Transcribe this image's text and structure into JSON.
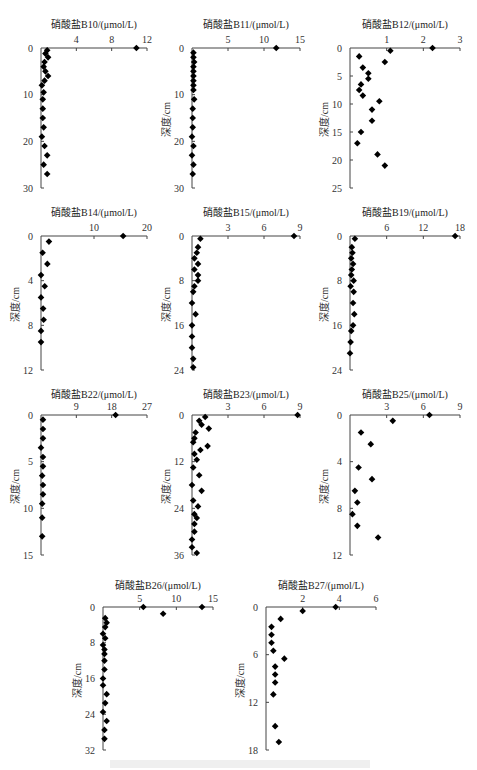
{
  "figure": {
    "y_axis_label": "深度/cm",
    "marker": "diamond",
    "marker_color": "#000000"
  },
  "chart_data": [
    {
      "type": "scatter",
      "id": "B10",
      "title": "硝酸盐B10/(μmol/L)",
      "xlabel": "硝酸盐B10/(μmol/L)",
      "ylabel": "",
      "x_ticks": [
        4,
        8,
        12
      ],
      "x_range": [
        0,
        12
      ],
      "y_ticks": [
        0,
        10,
        20,
        30
      ],
      "y_range": [
        0,
        30
      ],
      "y_inverted": true,
      "points": [
        [
          10.8,
          0
        ],
        [
          0.7,
          0.5
        ],
        [
          0.5,
          1.2
        ],
        [
          0.8,
          2
        ],
        [
          0.4,
          3
        ],
        [
          0.3,
          4
        ],
        [
          0.5,
          5
        ],
        [
          0.8,
          6
        ],
        [
          0.4,
          7
        ],
        [
          0.1,
          8
        ],
        [
          0.3,
          9.5
        ],
        [
          0.2,
          11
        ],
        [
          0.2,
          13
        ],
        [
          0.2,
          15
        ],
        [
          0.3,
          17
        ],
        [
          0.1,
          19
        ],
        [
          0.4,
          21
        ],
        [
          0.7,
          23
        ],
        [
          0.3,
          25
        ],
        [
          0.7,
          27
        ]
      ],
      "layout": {
        "x0": 41,
        "x1": 147,
        "y0": 48,
        "y1": 188,
        "title_y": 16,
        "show_ylabel": false
      }
    },
    {
      "type": "scatter",
      "id": "B11",
      "title": "硝酸盐B11/(μmol/L)",
      "xlabel": "硝酸盐B11/(μmol/L)",
      "ylabel": "深度/cm",
      "x_ticks": [
        5,
        10,
        15
      ],
      "x_range": [
        0,
        15
      ],
      "y_ticks": [
        0,
        10,
        20,
        30
      ],
      "y_range": [
        0,
        30
      ],
      "y_inverted": true,
      "points": [
        [
          11.7,
          0
        ],
        [
          0.2,
          1
        ],
        [
          0.2,
          2
        ],
        [
          0.3,
          3
        ],
        [
          0.2,
          4
        ],
        [
          0.2,
          5
        ],
        [
          0.2,
          6
        ],
        [
          0.2,
          7
        ],
        [
          0.2,
          8
        ],
        [
          0.2,
          9
        ],
        [
          0.3,
          11
        ],
        [
          0.1,
          13
        ],
        [
          0.1,
          15
        ],
        [
          0.1,
          17
        ],
        [
          0.0,
          19
        ],
        [
          0.2,
          21
        ],
        [
          0.0,
          23
        ],
        [
          0.2,
          25
        ],
        [
          0.1,
          27
        ]
      ],
      "layout": {
        "x0": 192,
        "x1": 300,
        "y0": 48,
        "y1": 188,
        "title_y": 16,
        "show_ylabel": true
      }
    },
    {
      "type": "scatter",
      "id": "B12",
      "title": "硝酸盐B12/(μmol/L)",
      "xlabel": "硝酸盐B12/(μmol/L)",
      "ylabel": "深度/cm",
      "x_ticks": [
        1,
        2,
        3
      ],
      "x_range": [
        0,
        3
      ],
      "y_ticks": [
        0,
        5,
        10,
        15,
        20,
        25
      ],
      "y_range": [
        0,
        25
      ],
      "y_inverted": true,
      "points": [
        [
          2.25,
          0
        ],
        [
          1.1,
          0.5
        ],
        [
          0.25,
          1.5
        ],
        [
          0.95,
          2.5
        ],
        [
          0.35,
          3.5
        ],
        [
          0.5,
          4.5
        ],
        [
          0.5,
          5.5
        ],
        [
          0.3,
          6.5
        ],
        [
          0.25,
          7.5
        ],
        [
          0.35,
          8.5
        ],
        [
          0.8,
          9.5
        ],
        [
          0.6,
          11
        ],
        [
          0.6,
          13
        ],
        [
          0.3,
          15
        ],
        [
          0.2,
          17
        ],
        [
          0.75,
          19
        ],
        [
          0.95,
          21
        ]
      ],
      "layout": {
        "x0": 350,
        "x1": 460,
        "y0": 48,
        "y1": 188,
        "title_y": 16,
        "show_ylabel": true
      }
    },
    {
      "type": "scatter",
      "id": "B14",
      "title": "硝酸盐B14/(μmol/L)",
      "xlabel": "硝酸盐B14/(μmol/L)",
      "ylabel": "深度/cm",
      "x_ticks": [
        10,
        20
      ],
      "x_range": [
        0,
        20
      ],
      "y_ticks": [
        0,
        4,
        8,
        12
      ],
      "y_range": [
        0,
        12
      ],
      "y_inverted": true,
      "points": [
        [
          15.5,
          0
        ],
        [
          1.5,
          0.5
        ],
        [
          0.3,
          1.5
        ],
        [
          1.2,
          2.5
        ],
        [
          0,
          3.5
        ],
        [
          0.7,
          4.5
        ],
        [
          0,
          5.5
        ],
        [
          0.4,
          6.5
        ],
        [
          0.5,
          7.5
        ],
        [
          0,
          8.5
        ],
        [
          0,
          9.5
        ]
      ],
      "layout": {
        "x0": 41,
        "x1": 147,
        "y0": 236,
        "y1": 370,
        "title_y": 204,
        "show_ylabel": true
      }
    },
    {
      "type": "scatter",
      "id": "B15",
      "title": "硝酸盐B15/(μmol/L)",
      "xlabel": "硝酸盐B15/(μmol/L)",
      "ylabel": "深度/cm",
      "x_ticks": [
        3,
        6,
        9
      ],
      "x_range": [
        0,
        9
      ],
      "y_ticks": [
        0,
        8,
        16,
        24
      ],
      "y_range": [
        0,
        24
      ],
      "y_inverted": true,
      "points": [
        [
          8.5,
          0
        ],
        [
          0.7,
          0.5
        ],
        [
          0.5,
          2
        ],
        [
          0.4,
          3
        ],
        [
          0.2,
          4
        ],
        [
          0.5,
          5
        ],
        [
          0.2,
          6
        ],
        [
          0.5,
          7
        ],
        [
          0.5,
          8
        ],
        [
          0.2,
          9
        ],
        [
          0.1,
          10
        ],
        [
          0,
          12
        ],
        [
          0.3,
          14
        ],
        [
          0,
          16
        ],
        [
          0,
          18
        ],
        [
          0,
          20
        ],
        [
          0.1,
          22
        ],
        [
          0.1,
          23.5
        ]
      ],
      "layout": {
        "x0": 192,
        "x1": 300,
        "y0": 236,
        "y1": 370,
        "title_y": 204,
        "show_ylabel": true
      }
    },
    {
      "type": "scatter",
      "id": "B19",
      "title": "硝酸盐B19/(μmol/L)",
      "xlabel": "硝酸盐B19/(μmol/L)",
      "ylabel": "深度/cm",
      "x_ticks": [
        6,
        12,
        18
      ],
      "x_range": [
        0,
        18
      ],
      "y_ticks": [
        0,
        8,
        16,
        24
      ],
      "y_range": [
        0,
        24
      ],
      "y_inverted": true,
      "points": [
        [
          17.2,
          0
        ],
        [
          0.8,
          0.5
        ],
        [
          0.3,
          2
        ],
        [
          0.4,
          3
        ],
        [
          0.2,
          4
        ],
        [
          0.5,
          5
        ],
        [
          0.3,
          6
        ],
        [
          0.2,
          7
        ],
        [
          0.6,
          8
        ],
        [
          0.1,
          9
        ],
        [
          0.6,
          10
        ],
        [
          0.5,
          12
        ],
        [
          0.7,
          14
        ],
        [
          0.5,
          16
        ],
        [
          0.2,
          17
        ],
        [
          0.1,
          19
        ],
        [
          0,
          21
        ]
      ],
      "layout": {
        "x0": 350,
        "x1": 460,
        "y0": 236,
        "y1": 370,
        "title_y": 204,
        "show_ylabel": true
      }
    },
    {
      "type": "scatter",
      "id": "B22",
      "title": "硝酸盐B22/(μmol/L)",
      "xlabel": "硝酸盐B22/(μmol/L)",
      "ylabel": "深度/cm",
      "x_ticks": [
        9,
        18,
        27
      ],
      "x_range": [
        0,
        27
      ],
      "y_ticks": [
        0,
        5,
        10,
        15
      ],
      "y_range": [
        0,
        15
      ],
      "y_inverted": true,
      "points": [
        [
          19,
          0
        ],
        [
          0.5,
          0.5
        ],
        [
          0.5,
          1.5
        ],
        [
          0.5,
          2.5
        ],
        [
          0,
          3.5
        ],
        [
          0.5,
          4.5
        ],
        [
          0.5,
          5.5
        ],
        [
          0.3,
          6.5
        ],
        [
          0.5,
          7.5
        ],
        [
          0.5,
          8.5
        ],
        [
          0.3,
          9.5
        ],
        [
          0.3,
          11
        ],
        [
          0.3,
          13
        ]
      ],
      "layout": {
        "x0": 41,
        "x1": 147,
        "y0": 415,
        "y1": 555,
        "title_y": 386,
        "show_ylabel": true
      }
    },
    {
      "type": "scatter",
      "id": "B23",
      "title": "硝酸盐B23/(μmol/L)",
      "xlabel": "硝酸盐B23/(μmol/L)",
      "ylabel": "深度/cm",
      "x_ticks": [
        3,
        6,
        9
      ],
      "x_range": [
        0,
        9
      ],
      "y_ticks": [
        0,
        12,
        24,
        36
      ],
      "y_range": [
        0,
        36
      ],
      "y_inverted": true,
      "points": [
        [
          8.8,
          0
        ],
        [
          1.1,
          0.5
        ],
        [
          0.6,
          1.5
        ],
        [
          0.8,
          2.5
        ],
        [
          1.4,
          3.5
        ],
        [
          0.3,
          4.5
        ],
        [
          0.2,
          6
        ],
        [
          0.1,
          7
        ],
        [
          1.3,
          8
        ],
        [
          0.7,
          9
        ],
        [
          0.2,
          10
        ],
        [
          0.4,
          11.5
        ],
        [
          0.1,
          13.5
        ],
        [
          0.6,
          15.5
        ],
        [
          0,
          18
        ],
        [
          0.8,
          19.5
        ],
        [
          0.1,
          22
        ],
        [
          0.5,
          23.5
        ],
        [
          0.2,
          25.5
        ],
        [
          0.4,
          26.5
        ],
        [
          0.2,
          28
        ],
        [
          0.2,
          30
        ],
        [
          0.0,
          32
        ],
        [
          0.0,
          34
        ],
        [
          0.4,
          35.5
        ]
      ],
      "layout": {
        "x0": 192,
        "x1": 300,
        "y0": 415,
        "y1": 555,
        "title_y": 386,
        "show_ylabel": true
      }
    },
    {
      "type": "scatter",
      "id": "B25",
      "title": "硝酸盐B25/(μmol/L)",
      "xlabel": "硝酸盐B25/(μmol/L)",
      "ylabel": "深度/cm",
      "x_ticks": [
        3,
        6,
        9
      ],
      "x_range": [
        0,
        9
      ],
      "y_ticks": [
        0,
        4,
        8,
        12
      ],
      "y_range": [
        0,
        12
      ],
      "y_inverted": true,
      "points": [
        [
          6.5,
          0
        ],
        [
          3.5,
          0.5
        ],
        [
          0.9,
          1.5
        ],
        [
          1.7,
          2.5
        ],
        [
          0.7,
          4.5
        ],
        [
          1.8,
          5.5
        ],
        [
          0.4,
          6.5
        ],
        [
          0.6,
          7.5
        ],
        [
          0.2,
          8.5
        ],
        [
          0.6,
          9.5
        ],
        [
          2.3,
          10.5
        ]
      ],
      "layout": {
        "x0": 350,
        "x1": 460,
        "y0": 415,
        "y1": 555,
        "title_y": 386,
        "show_ylabel": true
      }
    },
    {
      "type": "scatter",
      "id": "B26",
      "title": "硝酸盐B26/(μmol/L)",
      "xlabel": "硝酸盐B26/(μmol/L)",
      "ylabel": "深度/cm",
      "x_ticks": [
        5,
        10,
        15
      ],
      "x_range": [
        0,
        15
      ],
      "y_ticks": [
        0,
        8,
        16,
        24,
        32
      ],
      "y_range": [
        0,
        32
      ],
      "y_inverted": true,
      "points": [
        [
          5.5,
          0
        ],
        [
          13.5,
          0
        ],
        [
          8.2,
          1.5
        ],
        [
          0.3,
          2.5
        ],
        [
          0.5,
          3.5
        ],
        [
          0.3,
          4.5
        ],
        [
          0,
          6
        ],
        [
          0.3,
          7
        ],
        [
          0,
          8.5
        ],
        [
          0.2,
          9.5
        ],
        [
          0.2,
          10.5
        ],
        [
          0.2,
          12
        ],
        [
          0.2,
          14
        ],
        [
          0,
          16
        ],
        [
          0,
          17.5
        ],
        [
          0.5,
          19.5
        ],
        [
          0.3,
          21.5
        ],
        [
          0,
          23.5
        ],
        [
          0.5,
          25.5
        ],
        [
          0.2,
          27.5
        ],
        [
          0.2,
          29.5
        ]
      ],
      "layout": {
        "x0": 103,
        "x1": 213,
        "y0": 607,
        "y1": 750,
        "title_y": 577,
        "show_ylabel": true
      }
    },
    {
      "type": "scatter",
      "id": "B27",
      "title": "硝酸盐B27/(μmol/L)",
      "xlabel": "硝酸盐B27/(μmol/L)",
      "ylabel": "深度/cm",
      "x_ticks": [
        2,
        4,
        6
      ],
      "x_range": [
        0,
        6
      ],
      "y_ticks": [
        0,
        6,
        12,
        18
      ],
      "y_range": [
        0,
        18
      ],
      "y_inverted": true,
      "points": [
        [
          3.8,
          0
        ],
        [
          2.0,
          0.5
        ],
        [
          0.8,
          1.5
        ],
        [
          0.3,
          2.5
        ],
        [
          0.3,
          3.5
        ],
        [
          0.3,
          4.5
        ],
        [
          0.4,
          5.5
        ],
        [
          1.0,
          6.5
        ],
        [
          0.5,
          7.5
        ],
        [
          0.5,
          8.5
        ],
        [
          0.5,
          9.5
        ],
        [
          0.4,
          11
        ],
        [
          0.5,
          15
        ],
        [
          0.7,
          17
        ]
      ],
      "layout": {
        "x0": 266,
        "x1": 376,
        "y0": 607,
        "y1": 750,
        "title_y": 577,
        "show_ylabel": true
      }
    }
  ]
}
